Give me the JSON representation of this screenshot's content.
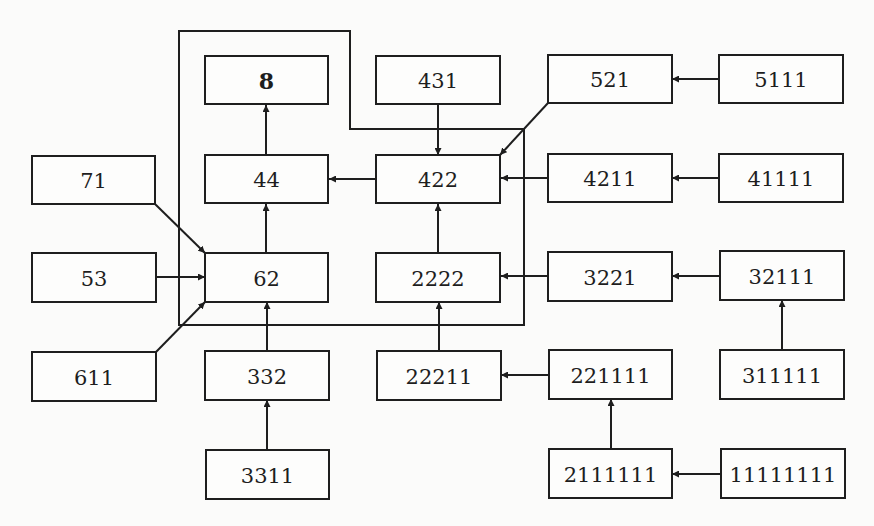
{
  "diagram": {
    "type": "flow",
    "background": "#fbfbfa",
    "stroke_color": "#1e1e1e",
    "nodes": [
      {
        "id": "n8",
        "label": "8",
        "bold": true,
        "x": 205,
        "y": 56,
        "w": 123,
        "h": 48
      },
      {
        "id": "n431",
        "label": "431",
        "bold": false,
        "x": 376,
        "y": 56,
        "w": 124,
        "h": 48
      },
      {
        "id": "n521",
        "label": "521",
        "bold": false,
        "x": 548,
        "y": 55,
        "w": 124,
        "h": 48
      },
      {
        "id": "n5111",
        "label": "5111",
        "bold": false,
        "x": 719,
        "y": 55,
        "w": 124,
        "h": 48
      },
      {
        "id": "n71",
        "label": "71",
        "bold": false,
        "x": 32,
        "y": 156,
        "w": 123,
        "h": 48
      },
      {
        "id": "n44",
        "label": "44",
        "bold": false,
        "x": 205,
        "y": 155,
        "w": 123,
        "h": 48
      },
      {
        "id": "n422",
        "label": "422",
        "bold": false,
        "x": 376,
        "y": 155,
        "w": 124,
        "h": 48
      },
      {
        "id": "n4211",
        "label": "4211",
        "bold": false,
        "x": 548,
        "y": 154,
        "w": 124,
        "h": 48
      },
      {
        "id": "n41111",
        "label": "41111",
        "bold": false,
        "x": 719,
        "y": 154,
        "w": 124,
        "h": 48
      },
      {
        "id": "n53",
        "label": "53",
        "bold": false,
        "x": 32,
        "y": 253,
        "w": 124,
        "h": 49
      },
      {
        "id": "n62",
        "label": "62",
        "bold": false,
        "x": 205,
        "y": 253,
        "w": 123,
        "h": 49
      },
      {
        "id": "n2222",
        "label": "2222",
        "bold": false,
        "x": 376,
        "y": 253,
        "w": 124,
        "h": 49
      },
      {
        "id": "n3221",
        "label": "3221",
        "bold": false,
        "x": 548,
        "y": 252,
        "w": 124,
        "h": 49
      },
      {
        "id": "n32111",
        "label": "32111",
        "bold": false,
        "x": 720,
        "y": 251,
        "w": 124,
        "h": 49
      },
      {
        "id": "n611",
        "label": "611",
        "bold": false,
        "x": 32,
        "y": 352,
        "w": 124,
        "h": 49
      },
      {
        "id": "n332",
        "label": "332",
        "bold": false,
        "x": 205,
        "y": 351,
        "w": 124,
        "h": 49
      },
      {
        "id": "n22211",
        "label": "22211",
        "bold": false,
        "x": 377,
        "y": 351,
        "w": 124,
        "h": 49
      },
      {
        "id": "n221111",
        "label": "221111",
        "bold": false,
        "x": 549,
        "y": 350,
        "w": 123,
        "h": 49
      },
      {
        "id": "n311111",
        "label": "311111",
        "bold": false,
        "x": 720,
        "y": 350,
        "w": 124,
        "h": 49
      },
      {
        "id": "n3311",
        "label": "3311",
        "bold": false,
        "x": 206,
        "y": 450,
        "w": 123,
        "h": 49
      },
      {
        "id": "n2111111",
        "label": "2111111",
        "bold": false,
        "x": 549,
        "y": 449,
        "w": 123,
        "h": 49
      },
      {
        "id": "n11111111",
        "label": "11111111",
        "bold": false,
        "x": 721,
        "y": 449,
        "w": 124,
        "h": 49
      }
    ],
    "edges": [
      {
        "from": "44",
        "to": "8",
        "points": [
          [
            266,
            155
          ],
          [
            266,
            105
          ]
        ]
      },
      {
        "from": "62",
        "to": "44",
        "points": [
          [
            266,
            253
          ],
          [
            266,
            204
          ]
        ]
      },
      {
        "from": "422",
        "to": "44",
        "points": [
          [
            376,
            179
          ],
          [
            329,
            179
          ]
        ]
      },
      {
        "from": "431",
        "to": "422",
        "points": [
          [
            438,
            104
          ],
          [
            438,
            155
          ]
        ]
      },
      {
        "from": "521",
        "to": "422",
        "points": [
          [
            548,
            103
          ],
          [
            500,
            155
          ]
        ]
      },
      {
        "from": "5111",
        "to": "521",
        "points": [
          [
            719,
            79
          ],
          [
            672,
            79
          ]
        ]
      },
      {
        "from": "4211",
        "to": "422",
        "points": [
          [
            548,
            178
          ],
          [
            501,
            178
          ]
        ]
      },
      {
        "from": "41111",
        "to": "4211",
        "points": [
          [
            719,
            178
          ],
          [
            672,
            178
          ]
        ]
      },
      {
        "from": "71",
        "to": "62",
        "points": [
          [
            155,
            204
          ],
          [
            205,
            253
          ]
        ]
      },
      {
        "from": "53",
        "to": "62",
        "points": [
          [
            156,
            277
          ],
          [
            205,
            277
          ]
        ]
      },
      {
        "from": "611",
        "to": "62",
        "points": [
          [
            156,
            352
          ],
          [
            205,
            302
          ]
        ]
      },
      {
        "from": "2222",
        "to": "422",
        "points": [
          [
            438,
            253
          ],
          [
            438,
            204
          ]
        ]
      },
      {
        "from": "3221",
        "to": "2222",
        "points": [
          [
            548,
            276
          ],
          [
            501,
            276
          ]
        ]
      },
      {
        "from": "32111",
        "to": "3221",
        "points": [
          [
            720,
            276
          ],
          [
            672,
            276
          ]
        ]
      },
      {
        "from": "311111",
        "to": "32111",
        "points": [
          [
            782,
            350
          ],
          [
            782,
            300
          ]
        ]
      },
      {
        "from": "332",
        "to": "62",
        "points": [
          [
            267,
            351
          ],
          [
            267,
            302
          ]
        ]
      },
      {
        "from": "3311",
        "to": "332",
        "points": [
          [
            267,
            450
          ],
          [
            267,
            400
          ]
        ]
      },
      {
        "from": "22211",
        "to": "2222",
        "points": [
          [
            439,
            351
          ],
          [
            439,
            302
          ]
        ]
      },
      {
        "from": "221111",
        "to": "22211",
        "points": [
          [
            549,
            375
          ],
          [
            501,
            375
          ]
        ]
      },
      {
        "from": "2111111",
        "to": "221111",
        "points": [
          [
            611,
            449
          ],
          [
            611,
            399
          ]
        ]
      },
      {
        "from": "11111111",
        "to": "2111111",
        "points": [
          [
            721,
            474
          ],
          [
            672,
            474
          ]
        ]
      }
    ],
    "outline": {
      "points": [
        [
          179,
          31
        ],
        [
          350,
          31
        ],
        [
          350,
          129
        ],
        [
          524,
          129
        ],
        [
          524,
          325
        ],
        [
          179,
          325
        ]
      ],
      "closed": true
    }
  }
}
